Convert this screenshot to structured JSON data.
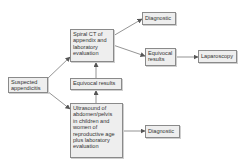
{
  "diagram": {
    "type": "flowchart",
    "nodes": {
      "start": {
        "label": "Suspected\nappendicitis"
      },
      "ct": {
        "label": "Spiral CT of\nappendix and\nlaboratory\nevaluation"
      },
      "equivocal_mid": {
        "label": "Equivocal results"
      },
      "ultrasound": {
        "label": "Ultrasound of\nabdomen/pelvis\nin children and\nwomen of\nreproductive age\nplus laboratory\nevaluation"
      },
      "diagnostic_top": {
        "label": "Diagnostic"
      },
      "equivocal_right": {
        "label": "Equivocal\nresults"
      },
      "laparoscopy": {
        "label": "Laparoscopy"
      },
      "diagnostic_bottom": {
        "label": "Diagnostic"
      }
    },
    "edges": [
      {
        "from": "start",
        "to": "ct"
      },
      {
        "from": "start",
        "to": "ultrasound"
      },
      {
        "from": "ultrasound",
        "to": "equivocal_mid"
      },
      {
        "from": "equivocal_mid",
        "to": "ct"
      },
      {
        "from": "ct",
        "to": "diagnostic_top"
      },
      {
        "from": "ct",
        "to": "equivocal_right"
      },
      {
        "from": "equivocal_right",
        "to": "laparoscopy"
      },
      {
        "from": "ultrasound",
        "to": "diagnostic_bottom"
      }
    ],
    "colors": {
      "box_fill": "#eeeeee",
      "box_border": "#8a8a8a",
      "line": "#555555",
      "text": "#333333"
    }
  }
}
